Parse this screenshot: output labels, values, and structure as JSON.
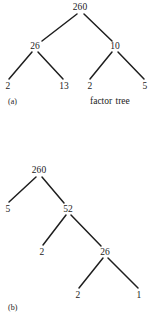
{
  "figure": {
    "kind": "factor-tree-figure",
    "ink_color": "#1e1e1e",
    "background_color": "#ffffff",
    "captions": [
      {
        "id": "caption-a",
        "text": "(a)",
        "x": 8,
        "y": 97
      },
      {
        "id": "caption-b",
        "text": "(b)",
        "x": 8,
        "y": 303
      }
    ],
    "annotations": [
      {
        "id": "factor-tree-caption",
        "text": "factor tree",
        "x": 90,
        "y": 96
      }
    ],
    "trees": [
      {
        "id": "tree-a",
        "part": "(a)",
        "root_value": "260",
        "factorization": "260 = 26 x 10 = (2 x 13) x (2 x 5)",
        "nodes": [
          {
            "id": "a-root",
            "label": "260",
            "x": 80,
            "y": 7
          },
          {
            "id": "a-l1-left",
            "label": "26",
            "x": 35,
            "y": 46
          },
          {
            "id": "a-l1-right",
            "label": "10",
            "x": 115,
            "y": 46
          },
          {
            "id": "a-leaf-1",
            "label": "2",
            "x": 8,
            "y": 86
          },
          {
            "id": "a-leaf-2",
            "label": "13",
            "x": 64,
            "y": 86
          },
          {
            "id": "a-leaf-3",
            "label": "2",
            "x": 90,
            "y": 86
          },
          {
            "id": "a-leaf-4",
            "label": "5",
            "x": 145,
            "y": 86
          }
        ],
        "edges": [
          {
            "id": "a-e1",
            "from": "a-root",
            "to": "a-l1-left",
            "x1": 77,
            "y1": 14,
            "x2": 42,
            "y2": 41
          },
          {
            "id": "a-e2",
            "from": "a-root",
            "to": "a-l1-right",
            "x1": 84,
            "y1": 14,
            "x2": 112,
            "y2": 41
          },
          {
            "id": "a-e3",
            "from": "a-l1-left",
            "to": "a-leaf-1",
            "x1": 32,
            "y1": 52,
            "x2": 9,
            "y2": 79
          },
          {
            "id": "a-e4",
            "from": "a-l1-left",
            "to": "a-leaf-2",
            "x1": 38,
            "y1": 52,
            "x2": 63,
            "y2": 79
          },
          {
            "id": "a-e5",
            "from": "a-l1-right",
            "to": "a-leaf-3",
            "x1": 112,
            "y1": 52,
            "x2": 90,
            "y2": 79
          },
          {
            "id": "a-e6",
            "from": "a-l1-right",
            "to": "a-leaf-4",
            "x1": 118,
            "y1": 52,
            "x2": 144,
            "y2": 79
          }
        ]
      },
      {
        "id": "tree-b",
        "part": "(b)",
        "root_value": "260",
        "factorization": "260 = 5 x 52 = 5 x 2 x 26 = 5 x 2 x 2 x 13",
        "nodes": [
          {
            "id": "b-root",
            "label": "260",
            "x": 39,
            "y": 170
          },
          {
            "id": "b-l1-left",
            "label": "5",
            "x": 8,
            "y": 209
          },
          {
            "id": "b-l1-right",
            "label": "52",
            "x": 68,
            "y": 209
          },
          {
            "id": "b-l2-left",
            "label": "2",
            "x": 42,
            "y": 252
          },
          {
            "id": "b-l2-right",
            "label": "26",
            "x": 105,
            "y": 252
          },
          {
            "id": "b-leaf-left",
            "label": "2",
            "x": 78,
            "y": 295
          },
          {
            "id": "b-leaf-right",
            "label": "1",
            "x": 139,
            "y": 295
          }
        ],
        "edges": [
          {
            "id": "b-e1",
            "from": "b-root",
            "to": "b-l1-left",
            "x1": 36,
            "y1": 177,
            "x2": 9,
            "y2": 202
          },
          {
            "id": "b-e2",
            "from": "b-root",
            "to": "b-l1-right",
            "x1": 42,
            "y1": 177,
            "x2": 64,
            "y2": 203
          },
          {
            "id": "b-e3",
            "from": "b-l1-right",
            "to": "b-l2-left",
            "x1": 66,
            "y1": 215,
            "x2": 43,
            "y2": 245
          },
          {
            "id": "b-e4",
            "from": "b-l1-right",
            "to": "b-l2-right",
            "x1": 71,
            "y1": 215,
            "x2": 101,
            "y2": 246
          },
          {
            "id": "b-e5",
            "from": "b-l2-right",
            "to": "b-leaf-left",
            "x1": 103,
            "y1": 258,
            "x2": 79,
            "y2": 288
          },
          {
            "id": "b-e6",
            "from": "b-l2-right",
            "to": "b-leaf-right",
            "x1": 108,
            "y1": 258,
            "x2": 138,
            "y2": 288
          }
        ]
      }
    ]
  }
}
